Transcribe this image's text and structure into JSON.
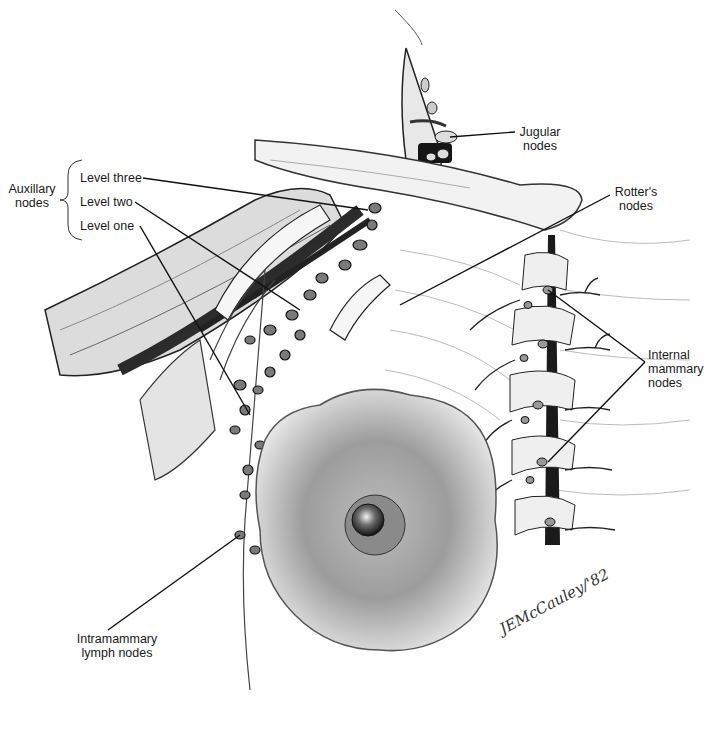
{
  "figure": {
    "colors": {
      "ink": "#1a1a1a",
      "shade": "#555555",
      "light": "#9a9a9a",
      "paper": "#ffffff"
    }
  },
  "labels": {
    "auxillary_group": "Auxillary\nnodes",
    "level_three": "Level three",
    "level_two": "Level two",
    "level_one": "Level one",
    "jugular": "Jugular\nnodes",
    "rotters": "Rotter's\nnodes",
    "internal_mammary": "Internal\nmammary\nnodes",
    "intramammary": "Intramammary\nlymph nodes"
  },
  "signature": "JEMcCauley/'82"
}
